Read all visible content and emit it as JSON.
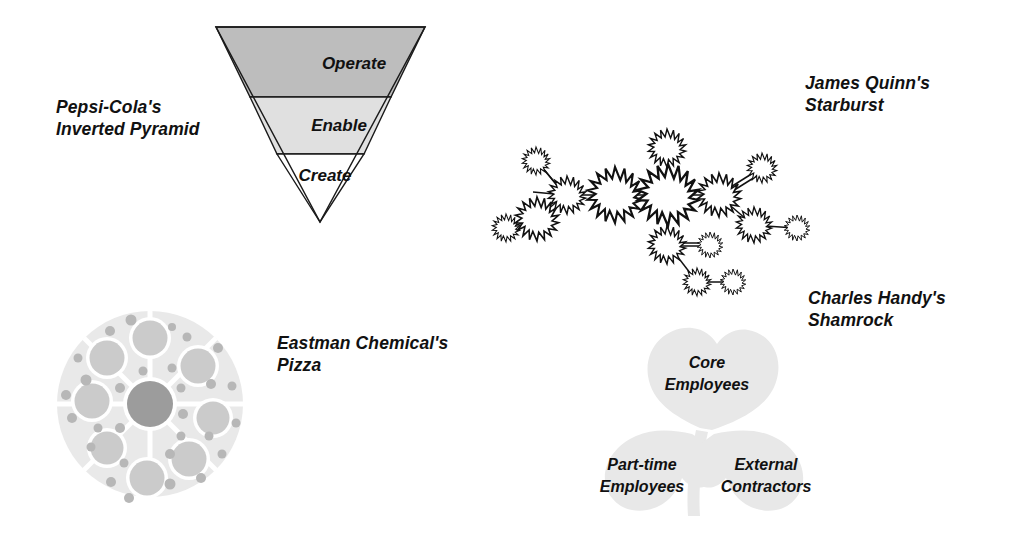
{
  "figure": {
    "background": "#ffffff",
    "width": 1010,
    "height": 551
  },
  "diagrams": [
    {
      "id": "inverted-pyramid",
      "caption": "Pepsi-Cola's\nInverted Pyramid",
      "shape": "inverted-triangle",
      "bands": [
        {
          "label": "Operate",
          "fill": "#bdbdbd"
        },
        {
          "label": "Enable",
          "fill": "#e0e0e0"
        },
        {
          "label": "Create",
          "fill": "#ffffff"
        }
      ],
      "stroke": "#1a1a1a"
    },
    {
      "id": "starburst",
      "caption": "James Quinn's\nStarburst",
      "shape": "starburst-network",
      "node_count": 16,
      "link_count": 15,
      "stroke": "#111111",
      "fill": "#ffffff"
    },
    {
      "id": "pizza",
      "caption": "Eastman Chemical's\nPizza",
      "shape": "pizza-circle",
      "base_fill": "#e8e8e8",
      "spoke_fill": "#ffffff",
      "hub_fill": "#9a9a9a",
      "topping_fill": "#c9c9c9",
      "crumb_fill": "#b5b5b5",
      "spoke_count": 8,
      "topping_count": 8,
      "crumb_count": 29
    },
    {
      "id": "shamrock",
      "caption": "Charles Handy's\nShamrock",
      "shape": "three-leaf-clover",
      "leaf_fill": "#e6e6e6",
      "leaves": [
        {
          "position": "top",
          "label": "Core\nEmployees"
        },
        {
          "position": "left",
          "label": "Part-time\nEmployees"
        },
        {
          "position": "right",
          "label": "External\nContractors"
        }
      ]
    }
  ],
  "chart_data": {
    "type": "diagram",
    "items": [
      {
        "name": "Pepsi-Cola's Inverted Pyramid",
        "layers": [
          "Operate",
          "Enable",
          "Create"
        ]
      },
      {
        "name": "James Quinn's Starburst",
        "nodes": 16
      },
      {
        "name": "Eastman Chemical's Pizza",
        "segments": 8
      },
      {
        "name": "Charles Handy's Shamrock",
        "leaves": [
          "Core Employees",
          "Part-time Employees",
          "External Contractors"
        ]
      }
    ]
  }
}
